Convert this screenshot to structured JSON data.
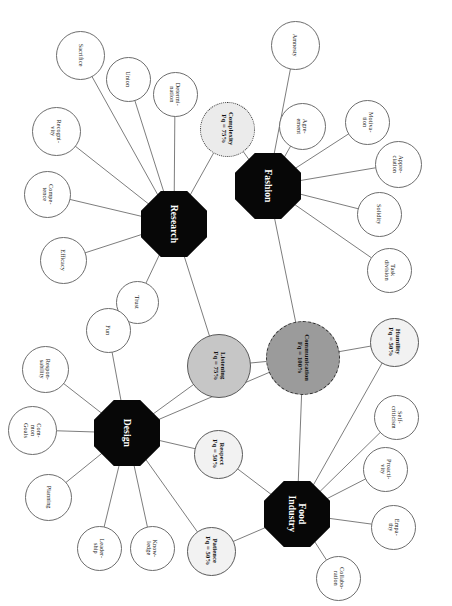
{
  "diagram": {
    "type": "node-link-network",
    "canvas": {
      "width": 452,
      "height": 606
    },
    "text_rotation_deg": 90,
    "colors": {
      "hub_fill": "#070707",
      "hub_text": "#ffffff",
      "leaf_fill": "#ffffff",
      "leaf_stroke": "#6d6d6d",
      "edge_stroke": "#6e6e6e",
      "attr_100_fill": "#9b9b9b",
      "attr_75_fill": "#c6c6c6",
      "attr_75_dot_fill": "#ebebeb",
      "attr_50_fill": "#f2f2f2",
      "background": "#ffffff"
    },
    "hubs": [
      {
        "id": "research",
        "label": "Research",
        "cx": 174,
        "cy": 224,
        "size": 66
      },
      {
        "id": "fashion",
        "label": "Fashion",
        "cx": 268,
        "cy": 186,
        "size": 66
      },
      {
        "id": "design",
        "label": "Design",
        "cx": 127,
        "cy": 433,
        "size": 66
      },
      {
        "id": "food_industry",
        "label": "Food\nIndustry",
        "cx": 297,
        "cy": 514,
        "size": 66
      }
    ],
    "attributes": [
      {
        "id": "communication",
        "label": "Communication",
        "freq_label": "Fq = 100%",
        "freq": 100,
        "cx": 303,
        "cy": 358,
        "d": 74,
        "style": "fill-100"
      },
      {
        "id": "listening",
        "label": "Listening",
        "freq_label": "Fq = 75%",
        "freq": 75,
        "cx": 219,
        "cy": 366,
        "d": 64,
        "style": "fill-75"
      },
      {
        "id": "complexity",
        "label": "Complexity",
        "freq_label": "Fq = 75%",
        "freq": 75,
        "cx": 227,
        "cy": 129,
        "d": 55,
        "style": "fill-75-dot"
      },
      {
        "id": "humility",
        "label": "Humility",
        "freq_label": "Fq = 50%",
        "freq": 50,
        "cx": 394,
        "cy": 342,
        "d": 49,
        "style": "fill-50"
      },
      {
        "id": "respect",
        "label": "Respect",
        "freq_label": "Fq = 50%",
        "freq": 50,
        "cx": 218,
        "cy": 454,
        "d": 49,
        "style": "fill-50"
      },
      {
        "id": "patience",
        "label": "Patience",
        "freq_label": "Fq = 50%",
        "freq": 50,
        "cx": 211,
        "cy": 551,
        "d": 49,
        "style": "fill-50"
      }
    ],
    "leaves": [
      {
        "id": "sacrifice",
        "label": "Sacrifice",
        "cx": 80,
        "cy": 55,
        "d": 49,
        "hub": "research"
      },
      {
        "id": "union",
        "label": "Union",
        "cx": 128,
        "cy": 79,
        "d": 45,
        "hub": "research"
      },
      {
        "id": "determination",
        "label": "Determi-\nnation",
        "cx": 175,
        "cy": 94,
        "d": 45,
        "hub": "research"
      },
      {
        "id": "recognition",
        "label": "Recogni-\nvity",
        "cx": 56,
        "cy": 131,
        "d": 49,
        "hub": "research"
      },
      {
        "id": "competence",
        "label": "Compe-\ntence",
        "cx": 47,
        "cy": 194,
        "d": 47,
        "hub": "research"
      },
      {
        "id": "efficacy",
        "label": "Efficacy",
        "cx": 63,
        "cy": 260,
        "d": 47,
        "hub": "research"
      },
      {
        "id": "trust",
        "label": "Trust",
        "cx": 137,
        "cy": 302,
        "d": 43,
        "hub": "research"
      },
      {
        "id": "amnesty",
        "label": "Amnesty",
        "cx": 295,
        "cy": 45,
        "d": 49,
        "hub": "fashion"
      },
      {
        "id": "agreement",
        "label": "Agre-\nement",
        "cx": 302,
        "cy": 126,
        "d": 47,
        "hub": "fashion"
      },
      {
        "id": "motivation",
        "label": "Motiva-\ntion",
        "cx": 367,
        "cy": 122,
        "d": 45,
        "hub": "fashion"
      },
      {
        "id": "appreciation",
        "label": "Appre-\nciation",
        "cx": 398,
        "cy": 164,
        "d": 47,
        "hub": "fashion"
      },
      {
        "id": "solidity",
        "label": "Solidity",
        "cx": 379,
        "cy": 214,
        "d": 45,
        "hub": "fashion"
      },
      {
        "id": "task_division",
        "label": "Task\ndivision",
        "cx": 389,
        "cy": 270,
        "d": 45,
        "hub": "fashion"
      },
      {
        "id": "fun",
        "label": "Fun",
        "cx": 108,
        "cy": 330,
        "d": 45,
        "hub": "design"
      },
      {
        "id": "responsability",
        "label": "Respon-\nsability",
        "cx": 45,
        "cy": 369,
        "d": 47,
        "hub": "design"
      },
      {
        "id": "common_goals",
        "label": "Com-\nmon\nGoals",
        "cx": 32,
        "cy": 430,
        "d": 49,
        "hub": "design"
      },
      {
        "id": "planning",
        "label": "Planning",
        "cx": 48,
        "cy": 497,
        "d": 47,
        "hub": "design"
      },
      {
        "id": "leadership",
        "label": "Leader-\nship",
        "cx": 99,
        "cy": 548,
        "d": 45,
        "hub": "design"
      },
      {
        "id": "knowledge",
        "label": "Know-\nledge",
        "cx": 152,
        "cy": 548,
        "d": 45,
        "hub": "design"
      },
      {
        "id": "self_criticism",
        "label": "Self-\ncriticism",
        "cx": 396,
        "cy": 417,
        "d": 45,
        "hub": "food_industry"
      },
      {
        "id": "proactivity",
        "label": "Proacti-\nvity",
        "cx": 385,
        "cy": 469,
        "d": 45,
        "hub": "food_industry"
      },
      {
        "id": "empathy",
        "label": "Empa-\nthy",
        "cx": 393,
        "cy": 527,
        "d": 45,
        "hub": "food_industry"
      },
      {
        "id": "collaboration",
        "label": "Collabo-\nration",
        "cx": 338,
        "cy": 578,
        "d": 45,
        "hub": "food_industry"
      }
    ],
    "edges": [
      {
        "from": "research",
        "to": "sacrifice"
      },
      {
        "from": "research",
        "to": "union"
      },
      {
        "from": "research",
        "to": "determination"
      },
      {
        "from": "research",
        "to": "recognition"
      },
      {
        "from": "research",
        "to": "competence"
      },
      {
        "from": "research",
        "to": "efficacy"
      },
      {
        "from": "research",
        "to": "trust"
      },
      {
        "from": "research",
        "to": "complexity"
      },
      {
        "from": "research",
        "to": "listening"
      },
      {
        "from": "fashion",
        "to": "amnesty"
      },
      {
        "from": "fashion",
        "to": "agreement"
      },
      {
        "from": "fashion",
        "to": "motivation"
      },
      {
        "from": "fashion",
        "to": "appreciation"
      },
      {
        "from": "fashion",
        "to": "solidity"
      },
      {
        "from": "fashion",
        "to": "task_division"
      },
      {
        "from": "fashion",
        "to": "complexity"
      },
      {
        "from": "fashion",
        "to": "communication"
      },
      {
        "from": "design",
        "to": "fun"
      },
      {
        "from": "design",
        "to": "responsability"
      },
      {
        "from": "design",
        "to": "common_goals"
      },
      {
        "from": "design",
        "to": "planning"
      },
      {
        "from": "design",
        "to": "leadership"
      },
      {
        "from": "design",
        "to": "knowledge"
      },
      {
        "from": "design",
        "to": "listening"
      },
      {
        "from": "design",
        "to": "respect"
      },
      {
        "from": "design",
        "to": "patience"
      },
      {
        "from": "design",
        "to": "communication"
      },
      {
        "from": "food_industry",
        "to": "self_criticism"
      },
      {
        "from": "food_industry",
        "to": "proactivity"
      },
      {
        "from": "food_industry",
        "to": "empathy"
      },
      {
        "from": "food_industry",
        "to": "collaboration"
      },
      {
        "from": "food_industry",
        "to": "humility"
      },
      {
        "from": "food_industry",
        "to": "respect"
      },
      {
        "from": "food_industry",
        "to": "patience"
      },
      {
        "from": "food_industry",
        "to": "communication"
      },
      {
        "from": "communication",
        "to": "humility"
      },
      {
        "from": "listening",
        "to": "communication"
      }
    ]
  }
}
